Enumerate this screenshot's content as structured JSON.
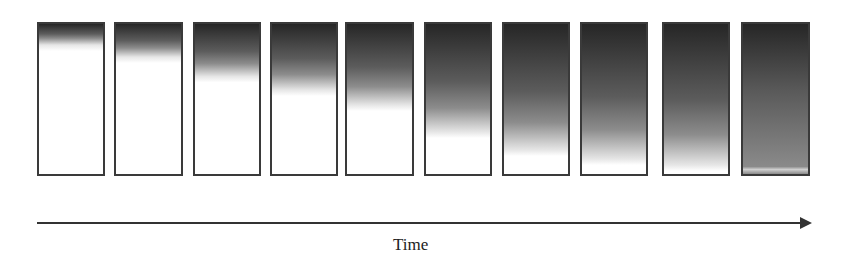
{
  "diagram": {
    "frames": [
      {
        "index": 1,
        "left": 37,
        "width": 68,
        "front_percent": 12,
        "bottom_shade": 0
      },
      {
        "index": 2,
        "left": 114,
        "width": 69,
        "front_percent": 20,
        "bottom_shade": 0
      },
      {
        "index": 3,
        "left": 193,
        "width": 68,
        "front_percent": 33,
        "bottom_shade": 0
      },
      {
        "index": 4,
        "left": 270,
        "width": 68,
        "front_percent": 42,
        "bottom_shade": 0
      },
      {
        "index": 5,
        "left": 345,
        "width": 69,
        "front_percent": 52,
        "bottom_shade": 0
      },
      {
        "index": 6,
        "left": 424,
        "width": 68,
        "front_percent": 70,
        "bottom_shade": 0
      },
      {
        "index": 7,
        "left": 502,
        "width": 68,
        "front_percent": 82,
        "bottom_shade": 0
      },
      {
        "index": 8,
        "left": 580,
        "width": 68,
        "front_percent": 88,
        "bottom_shade": 0
      },
      {
        "index": 9,
        "left": 662,
        "width": 68,
        "front_percent": 92,
        "bottom_shade": 0
      },
      {
        "index": 10,
        "left": 741,
        "width": 69,
        "front_percent": 100,
        "bottom_shade": 1
      }
    ],
    "axis": {
      "label": "Time",
      "direction": "left-to-right"
    },
    "colors": {
      "dark": "#262626",
      "mid": "#7a7a7a",
      "border": "#3a3a3a",
      "background": "#ffffff"
    }
  }
}
